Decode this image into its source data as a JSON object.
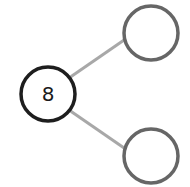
{
  "diagram": {
    "type": "number-bond",
    "whole": {
      "value": "8",
      "cx": 48,
      "cy": 94,
      "r": 27,
      "stroke": "#1e1e1e"
    },
    "parts": [
      {
        "value": "",
        "cx": 151,
        "cy": 33,
        "r": 27,
        "stroke": "#666666"
      },
      {
        "value": "",
        "cx": 151,
        "cy": 156,
        "r": 27,
        "stroke": "#666666"
      }
    ],
    "connector_color": "#a8a8a8",
    "background": "#ffffff"
  }
}
